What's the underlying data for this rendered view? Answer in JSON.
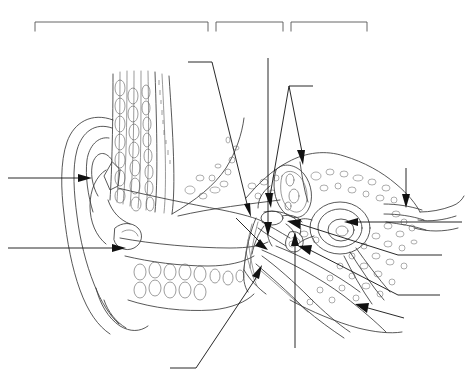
{
  "figure": {
    "style": "black-and-white line art",
    "background_color": "#ffffff",
    "line_color": "#3a3a3a",
    "leader_color": "#111111",
    "bracket_color": "#555555",
    "width": 468,
    "height": 388,
    "label_text_present": false,
    "note": "All label slots and brackets are blank - no text is printed anywhere in the image."
  },
  "brackets": [
    {
      "name": "bracket-outer-ear",
      "label": "",
      "x1": 35,
      "x2": 208,
      "y": 22,
      "tick_depth": 9
    },
    {
      "name": "bracket-middle-ear",
      "label": "",
      "x1": 216,
      "x2": 283,
      "y": 22,
      "tick_depth": 9
    },
    {
      "name": "bracket-inner-ear",
      "label": "",
      "x1": 291,
      "x2": 367,
      "y": 22,
      "tick_depth": 9
    }
  ],
  "leaders": [
    {
      "name": "leader-pinna",
      "label": "",
      "side": "left",
      "has_arrow": true
    },
    {
      "name": "leader-ear-lobe",
      "label": "",
      "side": "left",
      "has_arrow": true
    },
    {
      "name": "leader-ear-canal",
      "label": "",
      "side": "top",
      "has_arrow": true
    },
    {
      "name": "leader-eardrum",
      "label": "",
      "side": "top",
      "has_arrow": true
    },
    {
      "name": "leader-malleus",
      "label": "",
      "side": "top",
      "has_arrow": true
    },
    {
      "name": "leader-incus",
      "label": "",
      "side": "top",
      "has_arrow": true
    },
    {
      "name": "leader-semicircular-canals",
      "label": "",
      "side": "right",
      "has_arrow": true
    },
    {
      "name": "leader-cochlea",
      "label": "",
      "side": "right",
      "has_arrow": true
    },
    {
      "name": "leader-auditory-nerve",
      "label": "",
      "side": "right",
      "has_arrow": true
    },
    {
      "name": "leader-eustachian-tube",
      "label": "",
      "side": "right-lower",
      "has_arrow": true
    },
    {
      "name": "leader-stapes",
      "label": "",
      "side": "bottom",
      "has_arrow": true
    },
    {
      "name": "leader-oval-window",
      "label": "",
      "side": "bottom-left",
      "has_arrow": true
    },
    {
      "name": "leader-round-window",
      "label": "",
      "side": "bottom",
      "has_arrow": false
    }
  ],
  "structures": [
    {
      "name": "pinna",
      "label": ""
    },
    {
      "name": "ear-lobe",
      "label": ""
    },
    {
      "name": "ear-canal",
      "label": ""
    },
    {
      "name": "tympanic-membrane",
      "label": ""
    },
    {
      "name": "ossicles",
      "label": ""
    },
    {
      "name": "semicircular-canals",
      "label": ""
    },
    {
      "name": "cochlea",
      "label": ""
    },
    {
      "name": "eustachian-tube",
      "label": ""
    },
    {
      "name": "temporal-bone",
      "label": ""
    }
  ]
}
